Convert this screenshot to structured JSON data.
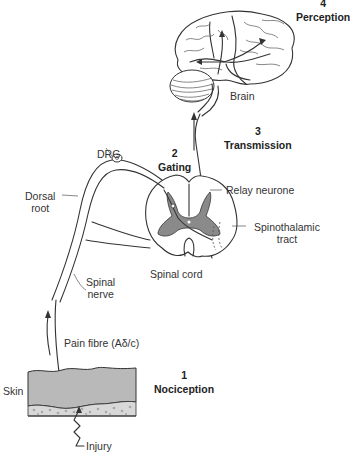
{
  "figure": {
    "steps": [
      {
        "number": "1",
        "name": "Nociception"
      },
      {
        "number": "2",
        "name": "Gating"
      },
      {
        "number": "3",
        "name": "Transmission"
      },
      {
        "number": "4",
        "name": "Perception"
      }
    ],
    "labels": {
      "brain": "Brain",
      "drg": "DRG",
      "dorsal_root_line1": "Dorsal",
      "dorsal_root_line2": "root",
      "relay_neurone": "Relay neurone",
      "spinothalamic_line1": "Spinothalamic",
      "spinothalamic_line2": "tract",
      "spinal_cord": "Spinal cord",
      "spinal_nerve_line1": "Spinal",
      "spinal_nerve_line2": "nerve",
      "pain_fibre": "Pain fibre (Aδ/c)",
      "skin": "Skin",
      "injury": "Injury"
    },
    "colors": {
      "line": "#333333",
      "grey_matter": "#8a8a8a",
      "skin": "#b9b9b9",
      "subcutis_dots": "#a8a8a8",
      "background": "#ffffff"
    }
  }
}
